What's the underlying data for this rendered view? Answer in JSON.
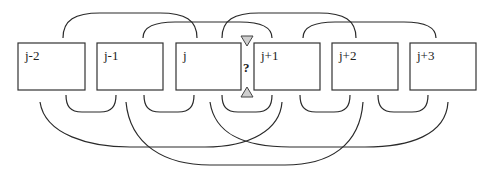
{
  "diagram": {
    "boxes": [
      {
        "label": "j-2"
      },
      {
        "label": "j-1"
      },
      {
        "label": "j"
      },
      {
        "label": "j+1"
      },
      {
        "label": "j+2"
      },
      {
        "label": "j+3"
      }
    ],
    "gap_marker": "?",
    "colors": {
      "stroke": "#2a2a2a",
      "triangle_fill": "#cfcfcf",
      "background": "#ffffff"
    }
  }
}
